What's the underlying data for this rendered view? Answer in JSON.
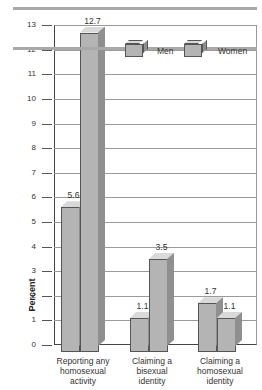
{
  "chart_data": {
    "type": "bar",
    "title": "",
    "xlabel": "",
    "ylabel": "Percent",
    "ylim": [
      0,
      13
    ],
    "yticks": [
      0,
      1,
      2,
      3,
      4,
      5,
      6,
      7,
      8,
      9,
      10,
      11,
      12,
      13
    ],
    "grid": true,
    "legend_position": "top-right",
    "categories": [
      "Reporting any homosexual activity",
      "Claiming a bisexual identity",
      "Claiming a homosexual identity"
    ],
    "category_lines": [
      [
        "Reporting any",
        "homosexual",
        "activity"
      ],
      [
        "Claiming a",
        "bisexual",
        "identity"
      ],
      [
        "Claiming a",
        "homosexual",
        "identity"
      ]
    ],
    "series": [
      {
        "name": "Men",
        "values": [
          5.6,
          1.1,
          1.7
        ],
        "labels": [
          "5.6",
          "1.1",
          "1.7"
        ]
      },
      {
        "name": "Women",
        "values": [
          12.7,
          3.5,
          1.1
        ],
        "labels": [
          "12.7",
          "3.5",
          "1.1"
        ]
      }
    ]
  },
  "legend": {
    "men": "Men",
    "women": "Women"
  },
  "colors": {
    "bar_front": "#b4b4b4",
    "bar_top": "#d9d9d9",
    "bar_side": "#8f8f8f",
    "rule": "#a9a9a9"
  }
}
